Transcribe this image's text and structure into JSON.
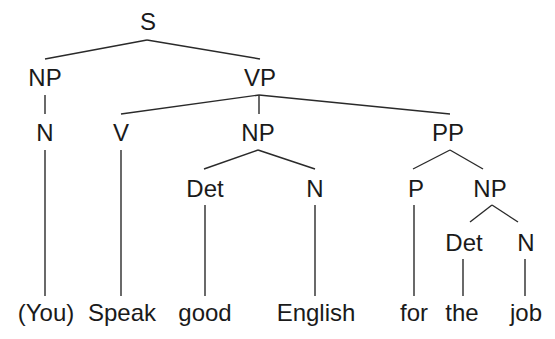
{
  "diagram": {
    "type": "syntax-tree",
    "colors": {
      "background": "#ffffff",
      "line": "#2a2a2a",
      "text": "#1a1a1a"
    },
    "nodes": [
      {
        "id": "S",
        "label": "S",
        "x": 148,
        "y": 30
      },
      {
        "id": "NP1",
        "label": "NP",
        "x": 45,
        "y": 86
      },
      {
        "id": "VP",
        "label": "VP",
        "x": 260,
        "y": 86
      },
      {
        "id": "N1",
        "label": "N",
        "x": 45,
        "y": 141
      },
      {
        "id": "V",
        "label": "V",
        "x": 121,
        "y": 141
      },
      {
        "id": "NP2",
        "label": "NP",
        "x": 258,
        "y": 141
      },
      {
        "id": "PP",
        "label": "PP",
        "x": 448,
        "y": 141
      },
      {
        "id": "Det1",
        "label": "Det",
        "x": 205,
        "y": 197
      },
      {
        "id": "N2",
        "label": "N",
        "x": 315,
        "y": 197
      },
      {
        "id": "P",
        "label": "P",
        "x": 416,
        "y": 197
      },
      {
        "id": "NP3",
        "label": "NP",
        "x": 490,
        "y": 197
      },
      {
        "id": "Det2",
        "label": "Det",
        "x": 464,
        "y": 251
      },
      {
        "id": "N3",
        "label": "N",
        "x": 526,
        "y": 251
      }
    ],
    "words": [
      {
        "id": "w1",
        "text": "(You)",
        "x": 46,
        "y": 321
      },
      {
        "id": "w2",
        "text": "Speak",
        "x": 122,
        "y": 321
      },
      {
        "id": "w3",
        "text": "good",
        "x": 205,
        "y": 321
      },
      {
        "id": "w4",
        "text": "English",
        "x": 316,
        "y": 321
      },
      {
        "id": "w5",
        "text": "for",
        "x": 414,
        "y": 321
      },
      {
        "id": "w6",
        "text": "the",
        "x": 462,
        "y": 321
      },
      {
        "id": "w7",
        "text": "job",
        "x": 526,
        "y": 321
      }
    ],
    "edges": [
      {
        "from": "S",
        "to": "NP1",
        "x1": 147,
        "y1": 40,
        "x2": 45,
        "y2": 59
      },
      {
        "from": "S",
        "to": "VP",
        "x1": 147,
        "y1": 40,
        "x2": 260,
        "y2": 59
      },
      {
        "from": "NP1",
        "to": "N1",
        "x1": 45,
        "y1": 95,
        "x2": 45,
        "y2": 114
      },
      {
        "from": "VP",
        "to": "V",
        "x1": 259,
        "y1": 95,
        "x2": 121,
        "y2": 114
      },
      {
        "from": "VP",
        "to": "NP2",
        "x1": 259,
        "y1": 95,
        "x2": 259,
        "y2": 114
      },
      {
        "from": "VP",
        "to": "PP",
        "x1": 259,
        "y1": 95,
        "x2": 450,
        "y2": 114
      },
      {
        "from": "N1",
        "to": "w1",
        "x1": 45,
        "y1": 150,
        "x2": 45,
        "y2": 296
      },
      {
        "from": "V",
        "to": "w2",
        "x1": 121,
        "y1": 150,
        "x2": 121,
        "y2": 296
      },
      {
        "from": "NP2",
        "to": "Det1",
        "x1": 258,
        "y1": 150,
        "x2": 204,
        "y2": 169
      },
      {
        "from": "NP2",
        "to": "N2",
        "x1": 258,
        "y1": 150,
        "x2": 315,
        "y2": 169
      },
      {
        "from": "PP",
        "to": "P",
        "x1": 450,
        "y1": 150,
        "x2": 413,
        "y2": 169
      },
      {
        "from": "PP",
        "to": "NP3",
        "x1": 450,
        "y1": 150,
        "x2": 483,
        "y2": 169
      },
      {
        "from": "Det1",
        "to": "w3",
        "x1": 205,
        "y1": 205,
        "x2": 205,
        "y2": 296
      },
      {
        "from": "N2",
        "to": "w4",
        "x1": 315,
        "y1": 205,
        "x2": 315,
        "y2": 296
      },
      {
        "from": "P",
        "to": "w5",
        "x1": 414,
        "y1": 205,
        "x2": 414,
        "y2": 296
      },
      {
        "from": "NP3",
        "to": "Det2",
        "x1": 492,
        "y1": 205,
        "x2": 470,
        "y2": 222
      },
      {
        "from": "NP3",
        "to": "N3",
        "x1": 492,
        "y1": 205,
        "x2": 518,
        "y2": 222
      },
      {
        "from": "Det2",
        "to": "w6",
        "x1": 463,
        "y1": 259,
        "x2": 463,
        "y2": 296
      },
      {
        "from": "N3",
        "to": "w7",
        "x1": 525,
        "y1": 259,
        "x2": 525,
        "y2": 296
      }
    ]
  }
}
